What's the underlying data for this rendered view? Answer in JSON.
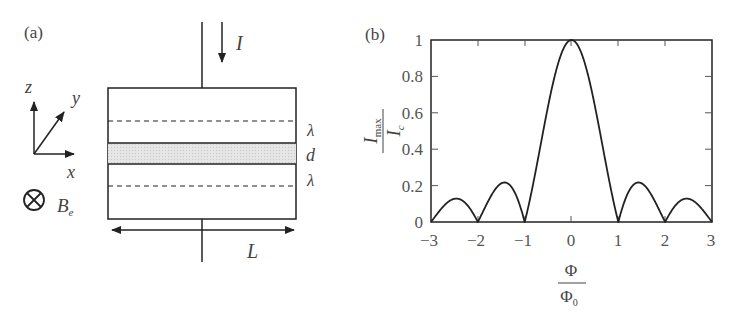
{
  "panel_a": {
    "label": "(a)",
    "current_label": "I",
    "axes": {
      "z": "z",
      "y": "y",
      "x": "x"
    },
    "field_label": "B",
    "field_subscript": "e",
    "layer_labels": [
      "λ",
      "d",
      "λ"
    ],
    "length_label": "L"
  },
  "panel_b": {
    "label": "(b)",
    "ylabel_num": "I",
    "ylabel_num_sub": "max",
    "ylabel_den": "I",
    "ylabel_den_sub": "c",
    "xlabel_num": "Φ",
    "xlabel_den": "Φ",
    "xlabel_den_sub": "0",
    "yticks": [
      "0",
      "0.2",
      "0.4",
      "0.6",
      "0.8",
      "1"
    ],
    "xticks": [
      "−3",
      "−2",
      "−1",
      "0",
      "1",
      "2",
      "3"
    ]
  },
  "chart_data": {
    "type": "line",
    "xlabel": "Φ/Φ0",
    "ylabel": "Imax/Ic",
    "xlim": [
      -3,
      3
    ],
    "ylim": [
      0,
      1
    ],
    "grid": false,
    "function": "|sin(πx)/(πx)|",
    "x": [
      -3,
      -2.5,
      -2,
      -1.5,
      -1,
      -0.5,
      0,
      0.5,
      1,
      1.5,
      2,
      2.5,
      3
    ],
    "values": [
      0,
      0.127,
      0,
      0.212,
      0,
      0.637,
      1,
      0.637,
      0,
      0.212,
      0,
      0.127,
      0
    ]
  }
}
